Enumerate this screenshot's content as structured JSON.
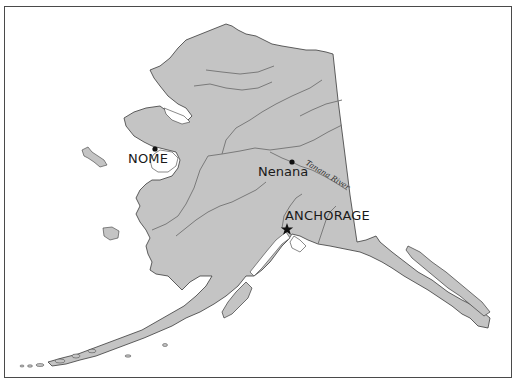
{
  "map": {
    "title": "Alaska",
    "colors": {
      "land": "#c4c4c4",
      "coast": "#3a3a3a",
      "river": "#7a7a7a",
      "water": "#ffffff",
      "frame": "#4a4a4a"
    },
    "places": [
      {
        "name": "NOME",
        "type": "city-dot",
        "x": 155,
        "y": 149
      },
      {
        "name": "Nenana",
        "type": "city-dot",
        "x": 292,
        "y": 162
      },
      {
        "name": "ANCHORAGE",
        "type": "capital-star",
        "x": 287,
        "y": 229
      }
    ],
    "rivers": [
      {
        "name": "Tanana River"
      }
    ]
  }
}
